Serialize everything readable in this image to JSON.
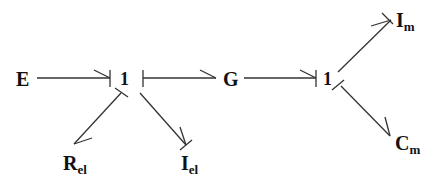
{
  "diagram": {
    "type": "bond-graph",
    "nodes": {
      "E": {
        "label": "E"
      },
      "J1": {
        "label": "1"
      },
      "G": {
        "label": "G"
      },
      "J2": {
        "label": "1"
      },
      "Rel": {
        "label": "R",
        "sub": "el"
      },
      "Iel": {
        "label": "I",
        "sub": "el"
      },
      "Im": {
        "label": "I",
        "sub": "m"
      },
      "Cm": {
        "label": "C",
        "sub": "m"
      }
    },
    "bonds": [
      {
        "from": "E",
        "to": "J1",
        "causal_stroke": "J1"
      },
      {
        "from": "J1",
        "to": "G",
        "causal_stroke": "J1"
      },
      {
        "from": "J1",
        "to": "Rel",
        "causal_stroke": "J1"
      },
      {
        "from": "J1",
        "to": "Iel",
        "causal_stroke": "Iel"
      },
      {
        "from": "G",
        "to": "J2",
        "causal_stroke": "J2"
      },
      {
        "from": "J2",
        "to": "Im",
        "causal_stroke": "Im"
      },
      {
        "from": "J2",
        "to": "Cm",
        "causal_stroke": "J2"
      }
    ]
  }
}
